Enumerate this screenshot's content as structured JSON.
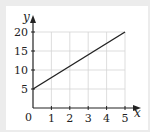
{
  "chart_data": {
    "type": "line",
    "title": "",
    "xlabel": "x",
    "ylabel": "y",
    "x": [
      0,
      5
    ],
    "series": [
      {
        "name": "line",
        "values": [
          5,
          20
        ]
      }
    ],
    "x_ticks": [
      "0",
      "1",
      "2",
      "3",
      "4",
      "5"
    ],
    "y_ticks": [
      "5",
      "10",
      "15",
      "20"
    ],
    "xlim": [
      0,
      5
    ],
    "ylim": [
      0,
      20
    ],
    "grid": true,
    "legend": "none",
    "origin_label": "0"
  },
  "colors": {
    "line": "#222222",
    "grid": "#d4d4d4",
    "axis": "#222222"
  }
}
